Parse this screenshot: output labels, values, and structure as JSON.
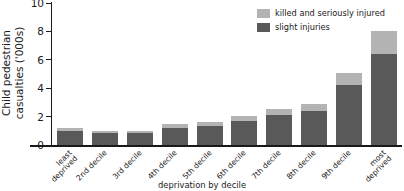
{
  "chart_data": {
    "type": "bar",
    "stacked": true,
    "title": "",
    "xlabel": "deprivation by decile",
    "ylabel": "Child pedestrian casualties ('000s)",
    "ylim": [
      0,
      10
    ],
    "yticks": [
      0,
      2,
      4,
      6,
      8,
      10
    ],
    "ytick_labels": [
      "0",
      "2",
      "4",
      "6",
      "8",
      "10"
    ],
    "grid": false,
    "legend_position": "top-right",
    "categories": [
      "least deprived",
      "2nd decile",
      "3rd decile",
      "4th decile",
      "5th decile",
      "6th decile",
      "7th decile",
      "8th decile",
      "9th decile",
      "most deprived"
    ],
    "category_lines": [
      [
        "least",
        "deprived"
      ],
      [
        "2nd decile"
      ],
      [
        "3rd decile"
      ],
      [
        "4th decile"
      ],
      [
        "5th decile"
      ],
      [
        "6th decile"
      ],
      [
        "7th decile"
      ],
      [
        "8th decile"
      ],
      [
        "9th decile"
      ],
      [
        "most",
        "deprived"
      ]
    ],
    "series": [
      {
        "name": "slight injuries",
        "color": "#595959",
        "values": [
          1.0,
          0.85,
          0.85,
          1.2,
          1.35,
          1.7,
          2.1,
          2.4,
          4.2,
          6.4
        ]
      },
      {
        "name": "killed and seriously injured",
        "color": "#b3b3b3",
        "values": [
          0.2,
          0.15,
          0.15,
          0.25,
          0.3,
          0.35,
          0.45,
          0.5,
          0.9,
          1.6
        ]
      }
    ],
    "totals": [
      1.2,
      1.0,
      1.0,
      1.45,
      1.65,
      2.05,
      2.55,
      2.9,
      5.1,
      8.0
    ]
  },
  "legend": {
    "items": [
      {
        "label": "killed and seriously injured",
        "color": "#b3b3b3"
      },
      {
        "label": "slight injuries",
        "color": "#595959"
      }
    ]
  },
  "axis": {
    "y_title_line1": "Child pedestrian",
    "y_title_line2": "casualties ('000s)"
  }
}
